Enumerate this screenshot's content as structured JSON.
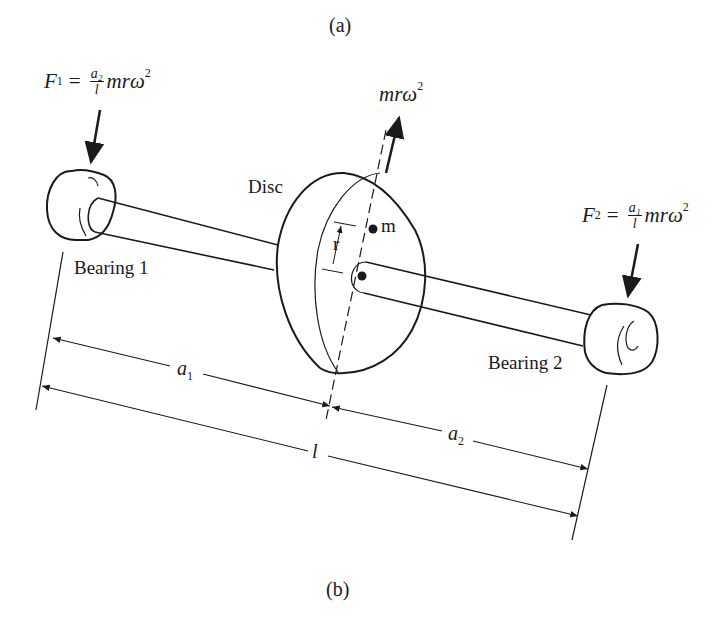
{
  "figure": {
    "caption_top": "(a)",
    "caption_bottom": "(b)"
  },
  "labels": {
    "disc": "Disc",
    "bearing1": "Bearing 1",
    "bearing2": "Bearing 2",
    "mass": "m",
    "radius": "r",
    "a1": "a",
    "a1_sub": "1",
    "a2": "a",
    "a2_sub": "2",
    "length": "l"
  },
  "forces": {
    "f1": {
      "symbol": "F",
      "sub": "1",
      "eq": "=",
      "num": "a₂",
      "den": "l",
      "tail": "mrω",
      "exp": "2"
    },
    "f2": {
      "symbol": "F",
      "sub": "2",
      "eq": "=",
      "num": "a₁",
      "den": "l",
      "tail": "mrω",
      "exp": "2"
    },
    "centrifugal": {
      "text": "mrω",
      "exp": "2"
    }
  },
  "colors": {
    "ink": "#1a1a1a",
    "background": "#ffffff"
  }
}
